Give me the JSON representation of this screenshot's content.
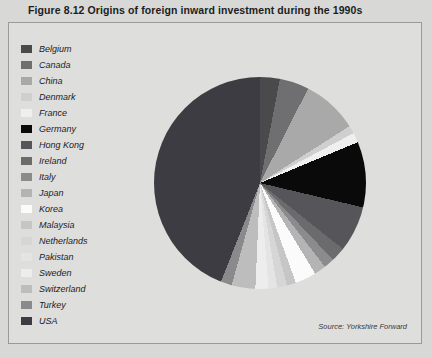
{
  "figure": {
    "title": "Figure 8.12  Origins of foreign inward investment during the 1990s",
    "source": "Source: Yorkshire Forward"
  },
  "chart_data": {
    "type": "pie",
    "title": "Origins of foreign inward investment during the 1990s",
    "xlabel": "",
    "ylabel": "",
    "legend_position": "left",
    "grid": false,
    "start_angle_deg": 0,
    "direction": "clockwise",
    "categories": [
      "Belgium",
      "Canada",
      "China",
      "Denmark",
      "France",
      "Germany",
      "Hong Kong",
      "Ireland",
      "Italy",
      "Japan",
      "Korea",
      "Malaysia",
      "Netherlands",
      "Pakistan",
      "Sweden",
      "Switzerland",
      "Turkey",
      "USA"
    ],
    "values": [
      3.0,
      4.5,
      8.5,
      1.2,
      1.5,
      10.0,
      7.0,
      2.2,
      1.6,
      1.8,
      3.2,
      1.4,
      1.5,
      1.3,
      2.0,
      3.6,
      1.7,
      44.0
    ],
    "unit": "percent",
    "slices": [
      {
        "label": "Belgium",
        "value": 3.0,
        "color": "#4a4a4c"
      },
      {
        "label": "Canada",
        "value": 4.5,
        "color": "#6f6f71"
      },
      {
        "label": "China",
        "value": 8.5,
        "color": "#a9a9a9"
      },
      {
        "label": "Denmark",
        "value": 1.2,
        "color": "#cfcfcf"
      },
      {
        "label": "France",
        "value": 1.5,
        "color": "#efefef"
      },
      {
        "label": "Germany",
        "value": 10.0,
        "color": "#0a0a0a"
      },
      {
        "label": "Hong Kong",
        "value": 7.0,
        "color": "#56565a"
      },
      {
        "label": "Ireland",
        "value": 2.2,
        "color": "#6b6b6d"
      },
      {
        "label": "Italy",
        "value": 1.6,
        "color": "#8b8b8d"
      },
      {
        "label": "Japan",
        "value": 1.8,
        "color": "#b4b4b4"
      },
      {
        "label": "Korea",
        "value": 3.2,
        "color": "#fbfbfb"
      },
      {
        "label": "Malaysia",
        "value": 1.4,
        "color": "#c6c6c6"
      },
      {
        "label": "Netherlands",
        "value": 1.5,
        "color": "#d6d6d6"
      },
      {
        "label": "Pakistan",
        "value": 1.3,
        "color": "#e4e4e4"
      },
      {
        "label": "Sweden",
        "value": 2.0,
        "color": "#ededed"
      },
      {
        "label": "Switzerland",
        "value": 3.6,
        "color": "#bdbdbd"
      },
      {
        "label": "Turkey",
        "value": 1.7,
        "color": "#8a8a8c"
      },
      {
        "label": "USA",
        "value": 44.0,
        "color": "#3c3c42"
      }
    ]
  },
  "legend": {
    "items": [
      {
        "label": "Belgium",
        "color": "#4a4a4c"
      },
      {
        "label": "Canada",
        "color": "#6f6f71"
      },
      {
        "label": "China",
        "color": "#a9a9a9"
      },
      {
        "label": "Denmark",
        "color": "#cfcfcf"
      },
      {
        "label": "France",
        "color": "#efefef"
      },
      {
        "label": "Germany",
        "color": "#0a0a0a"
      },
      {
        "label": "Hong Kong",
        "color": "#56565a"
      },
      {
        "label": "Ireland",
        "color": "#6b6b6d"
      },
      {
        "label": "Italy",
        "color": "#8b8b8d"
      },
      {
        "label": "Japan",
        "color": "#b4b4b4"
      },
      {
        "label": "Korea",
        "color": "#fbfbfb"
      },
      {
        "label": "Malaysia",
        "color": "#c6c6c6"
      },
      {
        "label": "Netherlands",
        "color": "#d6d6d6"
      },
      {
        "label": "Pakistan",
        "color": "#e4e4e4"
      },
      {
        "label": "Sweden",
        "color": "#ededed"
      },
      {
        "label": "Switzerland",
        "color": "#bdbdbd"
      },
      {
        "label": "Turkey",
        "color": "#8a8a8c"
      },
      {
        "label": "USA",
        "color": "#3c3c42"
      }
    ]
  }
}
